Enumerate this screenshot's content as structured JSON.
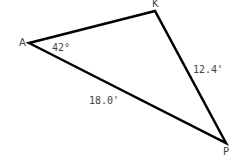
{
  "diagram": {
    "type": "triangle",
    "stroke_color": "#000000",
    "text_color": "#444444",
    "vertices": {
      "A": {
        "label": "A",
        "x": 29,
        "y": 43
      },
      "K": {
        "label": "K",
        "x": 155,
        "y": 11
      },
      "P": {
        "label": "P",
        "x": 226,
        "y": 143
      }
    },
    "angle_A": {
      "label": "42°"
    },
    "side_KP": {
      "label": "12.4'"
    },
    "side_AP": {
      "label": "18.0'"
    }
  }
}
